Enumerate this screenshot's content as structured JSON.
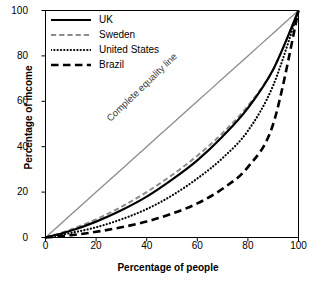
{
  "chart_data": {
    "type": "line",
    "title": "",
    "xlabel": "Percentage of people",
    "ylabel": "Percentage of income",
    "xlim": [
      0,
      100
    ],
    "ylim": [
      0,
      100
    ],
    "xticks": [
      0,
      20,
      40,
      60,
      80,
      100
    ],
    "yticks": [
      0,
      20,
      40,
      60,
      80,
      100
    ],
    "grid": false,
    "legend_position": "top-left inside axes",
    "annotations": [
      {
        "text": "Complete equality line",
        "rotation": -44,
        "color": "#808080"
      }
    ],
    "x": [
      0,
      10,
      20,
      30,
      40,
      50,
      60,
      70,
      80,
      90,
      100
    ],
    "series": [
      {
        "name": "Complete equality line",
        "style": "solid",
        "color": "#8c8c8c",
        "width": 1.3,
        "values": [
          0,
          10,
          20,
          30,
          40,
          50,
          60,
          70,
          80,
          90,
          100
        ]
      },
      {
        "name": "Sweden",
        "style": "dashed",
        "color": "#8c8c8c",
        "width": 2.0,
        "values": [
          0,
          3.5,
          8,
          13.5,
          20,
          27.5,
          36,
          46,
          58,
          74,
          100
        ]
      },
      {
        "name": "UK",
        "style": "solid",
        "color": "#000000",
        "width": 2.2,
        "values": [
          0,
          3,
          7,
          12,
          18,
          25.5,
          34,
          44.5,
          57,
          74,
          100
        ]
      },
      {
        "name": "United States",
        "style": "dotted",
        "color": "#000000",
        "width": 2.2,
        "values": [
          0,
          2,
          4.5,
          8,
          12.5,
          18.5,
          26,
          35,
          47,
          67,
          100
        ]
      },
      {
        "name": "Brazil",
        "style": "long-dash",
        "color": "#000000",
        "width": 2.6,
        "values": [
          0,
          1,
          2.5,
          4.5,
          7,
          10.5,
          15,
          21.5,
          31,
          50,
          100
        ]
      }
    ]
  },
  "legend": {
    "items": [
      {
        "label": "UK"
      },
      {
        "label": "Sweden"
      },
      {
        "label": "United States"
      },
      {
        "label": "Brazil"
      }
    ]
  },
  "axes": {
    "x_title": "Percentage of people",
    "y_title": "Percentage of income",
    "x_tick_labels": [
      "0",
      "20",
      "40",
      "60",
      "80",
      "100"
    ],
    "y_tick_labels": [
      "0",
      "20",
      "40",
      "60",
      "80",
      "100"
    ]
  },
  "annotation": {
    "equality_line_text": "Complete equality line"
  },
  "colors": {
    "equality_line": "#8c8c8c",
    "sweden": "#8c8c8c",
    "uk": "#000000",
    "united_states": "#000000",
    "brazil": "#000000",
    "frame": "#000000",
    "background": "#ffffff"
  }
}
